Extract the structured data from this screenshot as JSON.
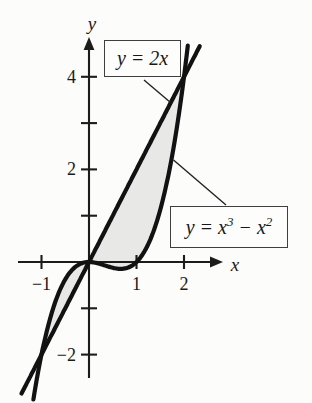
{
  "chart_data": {
    "type": "line",
    "title": "",
    "curves": [
      {
        "id": "line",
        "label": "y = 2x",
        "poly_coeffs": [
          0,
          2
        ],
        "x_range": [
          -1.42,
          2.33
        ]
      },
      {
        "id": "cubic",
        "label": "y = x³ − x²",
        "poly_coeffs": [
          0,
          0,
          -1,
          1
        ],
        "x_range": [
          -1.17,
          2.08
        ]
      }
    ],
    "shaded_regions": [
      {
        "upper": "cubic",
        "lower": "line",
        "x_from": -1,
        "x_to": 0
      },
      {
        "upper": "line",
        "lower": "cubic",
        "x_from": 0,
        "x_to": 2
      }
    ],
    "intersections": [
      [
        -1,
        -2
      ],
      [
        0,
        0
      ],
      [
        2,
        4
      ]
    ],
    "axes": {
      "x_label": "x",
      "y_label": "y",
      "x_ticks": [
        {
          "v": -1,
          "label": "−1"
        },
        {
          "v": 1,
          "label": "1"
        },
        {
          "v": 2,
          "label": "2"
        }
      ],
      "y_ticks": [
        {
          "v": -2,
          "label": "−2"
        },
        {
          "v": -1,
          "label": ""
        },
        {
          "v": 1,
          "label": ""
        },
        {
          "v": 2,
          "label": "2"
        },
        {
          "v": 3,
          "label": ""
        },
        {
          "v": 4,
          "label": "4"
        }
      ],
      "xlim": [
        -1.5,
        2.82
      ],
      "ylim": [
        -2.5,
        4.86
      ],
      "grid": false
    },
    "legend_position": "none",
    "colors": {
      "curve_stroke": "#121212",
      "region_fill": "#e8e8e6",
      "axis_stroke": "#1c1c1c",
      "leader_stroke": "#222222"
    }
  },
  "annotations": {
    "line_label": "y = 2x",
    "cubic_label_parts": {
      "p1": "y = x",
      "sup1": "3",
      "p2": " − x",
      "sup2": "2"
    }
  }
}
